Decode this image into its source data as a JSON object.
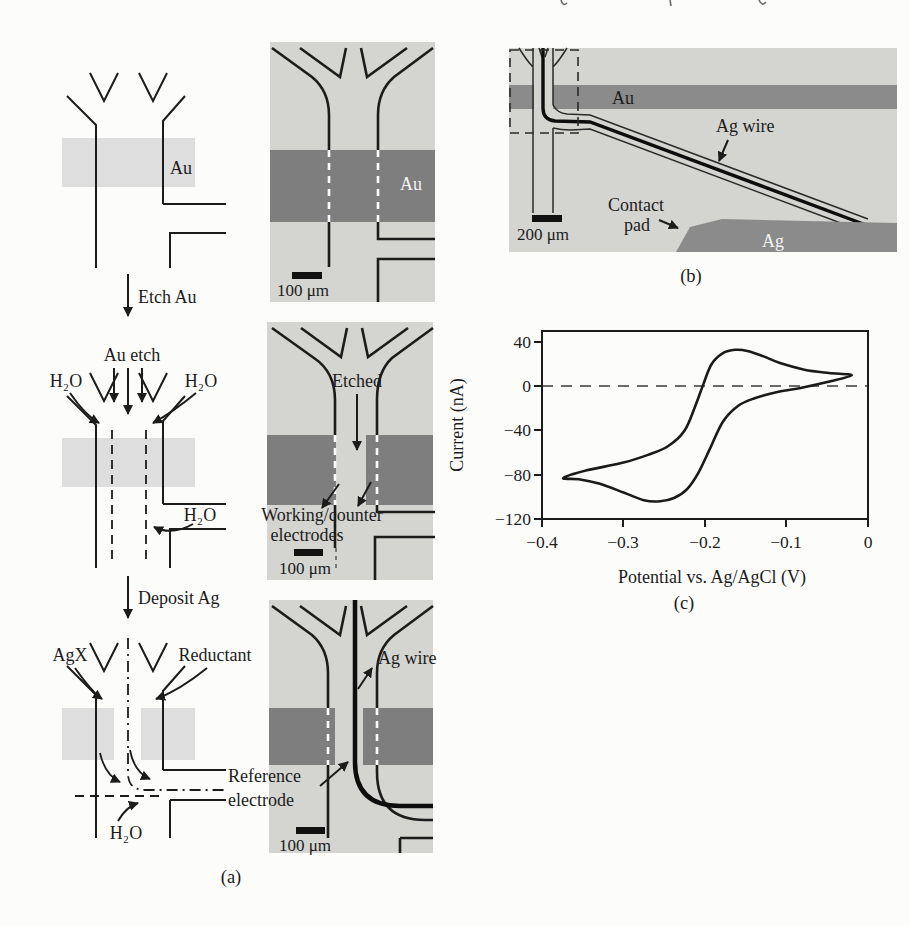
{
  "panel_a": {
    "caption": "(a)",
    "step1": {
      "band_label": "Au",
      "arrow_label": "Etch Au"
    },
    "step2": {
      "inlet_label": "Au etch",
      "h2o_left": "H₂O",
      "h2o_right": "H₂O",
      "h2o_outlet": "H₂O",
      "arrow_label": "Deposit Ag"
    },
    "step3": {
      "inlet_left": "AgX",
      "inlet_right": "Reductant",
      "h2o_inlet": "H₂O"
    },
    "micro1": {
      "band_label": "Au",
      "scale": "100 μm"
    },
    "micro2": {
      "flow_label": "Etched",
      "annotation_line1": "Working/counter",
      "annotation_line2": "electrodes",
      "scale": "100 μm"
    },
    "micro3": {
      "wire_label": "Ag wire",
      "annotation_line1": "Reference",
      "annotation_line2": "electrode",
      "scale": "100 μm"
    }
  },
  "panel_b": {
    "caption": "(b)",
    "band_label": "Au",
    "pad_label": "Ag",
    "wire_label": "Ag wire",
    "pad_annotation_line1": "Contact",
    "pad_annotation_line2": "pad",
    "scale": "200 μm"
  },
  "panel_c": {
    "caption": "(c)",
    "ylabel": "Current (nA)",
    "xlabel": "Potential vs. Ag/AgCl (V)",
    "y_tick_labels": [
      "40",
      "0",
      "−40",
      "−80",
      "−120"
    ],
    "x_tick_labels": [
      "−0.4",
      "−0.3",
      "−0.2",
      "−0.1",
      "0"
    ]
  },
  "chart_data": {
    "type": "line",
    "xlabel": "Potential vs. Ag/AgCl (V)",
    "ylabel": "Current (nA)",
    "xlim": [
      -0.4,
      0
    ],
    "ylim": [
      -120,
      50
    ],
    "x_ticks": [
      -0.4,
      -0.3,
      -0.2,
      -0.1,
      0
    ],
    "y_ticks": [
      40,
      0,
      -40,
      -80,
      -120
    ],
    "zero_line_y": 0,
    "grid": false,
    "legend": "none",
    "series": [
      {
        "name": "forward anodic sweep (upper branch)",
        "x": [
          -0.374,
          -0.345,
          -0.3,
          -0.27,
          -0.245,
          -0.225,
          -0.212,
          -0.202,
          -0.192,
          -0.178,
          -0.163,
          -0.148,
          -0.128,
          -0.108,
          -0.078,
          -0.048,
          -0.02
        ],
        "y": [
          -83,
          -76,
          -69,
          -62,
          -54,
          -40,
          -18,
          2,
          20,
          30,
          33,
          32,
          27,
          21,
          15,
          12,
          10
        ]
      },
      {
        "name": "reverse cathodic sweep (lower branch)",
        "x": [
          -0.02,
          -0.05,
          -0.08,
          -0.11,
          -0.14,
          -0.16,
          -0.178,
          -0.193,
          -0.208,
          -0.222,
          -0.238,
          -0.255,
          -0.275,
          -0.3,
          -0.33,
          -0.355,
          -0.374
        ],
        "y": [
          10,
          4,
          -1,
          -5,
          -11,
          -18,
          -32,
          -55,
          -78,
          -93,
          -101,
          -104,
          -103,
          -96,
          -88,
          -84,
          -83
        ]
      }
    ]
  },
  "colors": {
    "page": "#fcfcfb",
    "micrograph_bg": "#d4d4d1",
    "metal_dark": "#7e7e7e",
    "metal_medium": "#8b8b8b",
    "schematic_band": "#dedede",
    "line": "#1c1c1c",
    "white_dash": "#ffffff"
  }
}
